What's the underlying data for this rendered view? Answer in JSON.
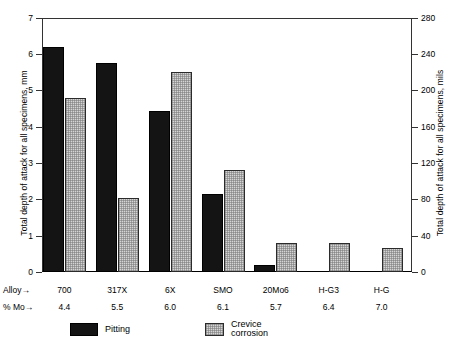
{
  "chart_data": {
    "type": "bar",
    "title": "",
    "categories": [
      "700",
      "317X",
      "6X",
      "SMO",
      "20Mo6",
      "H-G3",
      "H-G"
    ],
    "series": [
      {
        "name": "Pitting",
        "values": [
          6.2,
          5.75,
          4.45,
          2.15,
          0.2,
          0,
          0
        ]
      },
      {
        "name": "Crevice corrosion",
        "values": [
          4.8,
          2.05,
          5.5,
          2.8,
          0.8,
          0.8,
          0.65
        ]
      }
    ],
    "xlabel": "Alloy",
    "ylabel": "Total depth of attack for all specimens, mm",
    "ylabel_right": "Total depth of attack for all specimens, mils",
    "ylim": [
      0,
      7
    ],
    "ylim_right": [
      0,
      280
    ],
    "yticks": [
      0,
      1,
      2,
      3,
      4,
      5,
      6,
      7
    ],
    "yticks_right": [
      0,
      40,
      80,
      120,
      160,
      200,
      240,
      280
    ],
    "grid": false,
    "legend_position": "below-axes",
    "secondary_categories_label": "% Mo",
    "secondary_categories": [
      "4.4",
      "5.5",
      "6.0",
      "6.1",
      "5.7",
      "6.4",
      "7.0"
    ]
  },
  "axes": {
    "left_title": "Total depth of attack for all specimens, mm",
    "right_title": "Total depth of attack for all specimens, mils",
    "left_ticklabels": [
      "7",
      "6",
      "5",
      "4",
      "3",
      "2",
      "1",
      "0"
    ],
    "right_ticklabels": [
      "280",
      "240",
      "200",
      "160",
      "120",
      "80",
      "40",
      "0"
    ]
  },
  "rows": {
    "alloy_label": "Alloy",
    "mo_label": "% Mo",
    "arrow": "→",
    "alloy_values": [
      "700",
      "317X",
      "6X",
      "SMO",
      "20Mo6",
      "H-G3",
      "H-G"
    ],
    "mo_values": [
      "4.4",
      "5.5",
      "6.0",
      "6.1",
      "5.7",
      "6.4",
      "7.0"
    ]
  },
  "legend": {
    "pitting_label": "Pitting",
    "crevice_label": "Crevice corrosion"
  },
  "colors": {
    "pitting": "#141414",
    "crevice": "#d5d5d5",
    "axis": "#333333",
    "background": "#ffffff"
  }
}
